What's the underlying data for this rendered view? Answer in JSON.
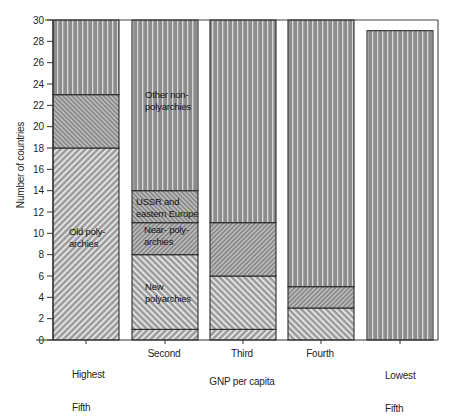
{
  "chart_data": {
    "type": "bar",
    "stacked": true,
    "title": "",
    "xlabel": "GNP per capita",
    "ylabel": "Number of countries",
    "ylim": [
      0,
      30
    ],
    "yticks": [
      0,
      2,
      4,
      6,
      8,
      10,
      12,
      14,
      16,
      18,
      20,
      22,
      24,
      26,
      28,
      30
    ],
    "grid": false,
    "legend": "none (labels drawn inside Second bar and Highest Fifth bar)",
    "categories": [
      "Highest Fifth",
      "Second",
      "Third",
      "Fourth",
      "Lowest Fifth"
    ],
    "category_labels": [
      {
        "line1": "Highest",
        "line2": "Fifth"
      },
      {
        "line1": "Second",
        "line2": ""
      },
      {
        "line1": "Third",
        "line2": ""
      },
      {
        "line1": "Fourth",
        "line2": ""
      },
      {
        "line1": "Lowest",
        "line2": "Fifth"
      }
    ],
    "series": [
      {
        "name": "Old polyarchies",
        "pattern": "p-old",
        "values": [
          18,
          1,
          1,
          0,
          0
        ]
      },
      {
        "name": "New polyarchies",
        "pattern": "p-new",
        "values": [
          0,
          7,
          5,
          3,
          0
        ]
      },
      {
        "name": "Near-polyarchies",
        "pattern": "p-near",
        "values": [
          0,
          3,
          5,
          2,
          0
        ]
      },
      {
        "name": "USSR and eastern Europe",
        "pattern": "p-ussr",
        "values": [
          5,
          3,
          0,
          0,
          0
        ]
      },
      {
        "name": "Other non-polyarchies",
        "pattern": "p-vert",
        "values": [
          7,
          16,
          19,
          25,
          29
        ]
      }
    ],
    "annotations": {
      "old": "Old poly-\narchies",
      "other": "Other non-\npolyarchies",
      "ussr": "USSR and\neastern Europe",
      "near": "Near- poly-\narchies",
      "new": "New\npolyarchies"
    }
  },
  "axes": {
    "x_title": "GNP per capita",
    "y_title": "Number of countries"
  }
}
